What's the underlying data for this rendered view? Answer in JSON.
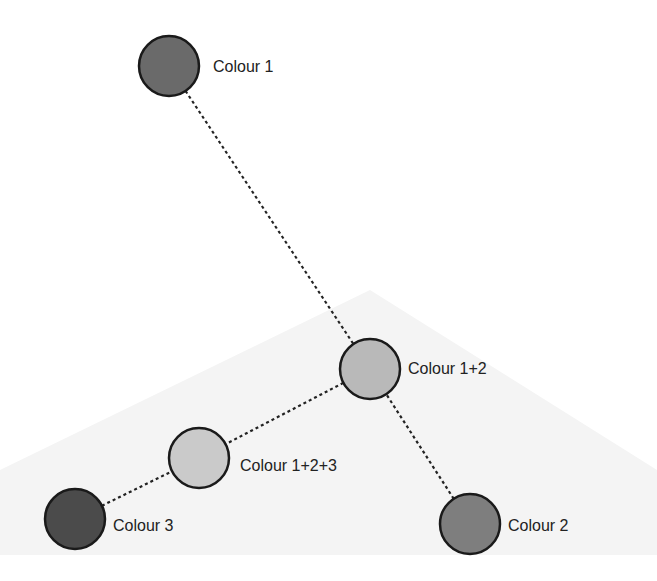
{
  "diagram": {
    "type": "colour-mixing-tree",
    "background": "#ffffff",
    "background_shape": {
      "type": "triangle",
      "fill": "#f4f4f4",
      "points": [
        [
          370,
          290
        ],
        [
          0,
          470
        ],
        [
          0,
          555
        ],
        [
          657,
          555
        ],
        [
          657,
          470
        ]
      ]
    },
    "edge_style": {
      "stroke": "#222222",
      "dash": "3,3",
      "width": 2.2
    },
    "node_stroke": "#1a1a1a",
    "nodes": [
      {
        "id": "c1",
        "label": "Colour 1",
        "cx": 169,
        "cy": 66,
        "r": 30,
        "fill": "#6a6a6a",
        "label_x": 213,
        "label_y": 57
      },
      {
        "id": "c12",
        "label": "Colour 1+2",
        "cx": 370,
        "cy": 369,
        "r": 30,
        "fill": "#b9b9b9",
        "label_x": 408,
        "label_y": 359
      },
      {
        "id": "c123",
        "label": "Colour 1+2+3",
        "cx": 199,
        "cy": 458,
        "r": 30,
        "fill": "#cacaca",
        "label_x": 240,
        "label_y": 456
      },
      {
        "id": "c3",
        "label": "Colour 3",
        "cx": 75,
        "cy": 519,
        "r": 30,
        "fill": "#4b4b4b",
        "label_x": 113,
        "label_y": 516
      },
      {
        "id": "c2",
        "label": "Colour 2",
        "cx": 470,
        "cy": 524,
        "r": 30,
        "fill": "#7e7e7e",
        "label_x": 508,
        "label_y": 516
      }
    ],
    "edges": [
      {
        "from": "c1",
        "to": "c12"
      },
      {
        "from": "c2",
        "to": "c12"
      },
      {
        "from": "c12",
        "to": "c123"
      },
      {
        "from": "c3",
        "to": "c123"
      }
    ]
  }
}
